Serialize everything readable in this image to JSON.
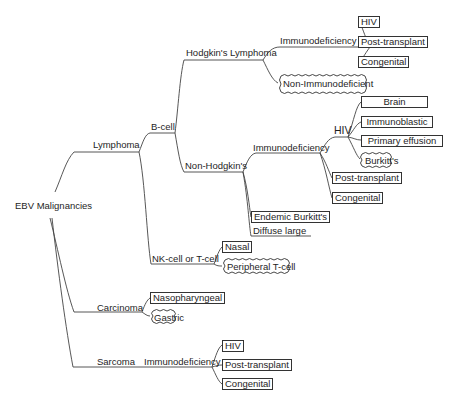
{
  "diagram": {
    "root": "EBV Malignancies",
    "lymphoma": {
      "label": "Lymphoma",
      "b_cell": {
        "label": "B-cell",
        "hodgkins": {
          "label": "Hodgkin's Lymphoma",
          "immunodeficiency": {
            "label": "Immunodeficiency",
            "children": [
              "HIV",
              "Post-transplant",
              "Congenital"
            ]
          },
          "non_immunodeficient": "Non-Immunodeficient"
        },
        "non_hodgkins": {
          "label": "Non-Hodgkin's",
          "immunodeficiency": {
            "label": "Immunodeficiency",
            "hiv": {
              "label": "HIV",
              "children": [
                "Brain",
                "Immunoblastic",
                "Primary effusion",
                "Burkitt's"
              ]
            },
            "post_transplant": "Post-transplant",
            "congenital": "Congenital"
          },
          "endemic_burkitts": "Endemic Burkitt's",
          "diffuse_large": "Diffuse large"
        }
      },
      "nk_t_cell": {
        "label": "NK-cell or T-cell",
        "children": [
          "Nasal",
          "Peripheral T-cell"
        ]
      }
    },
    "carcinoma": {
      "label": "Carcinoma",
      "children": [
        "Nasopharyngeal",
        "Gastric"
      ]
    },
    "sarcoma": {
      "label": "Sarcoma",
      "immunodeficiency": {
        "label": "Immunodeficiency",
        "children": [
          "HIV",
          "Post-transplant",
          "Congenital"
        ]
      }
    }
  }
}
